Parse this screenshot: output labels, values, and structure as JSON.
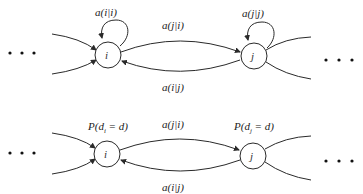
{
  "diagrams": [
    {
      "name": "top-chain",
      "nodes": [
        {
          "id": "i",
          "label": "i",
          "self_loop_label": "a(i|i)"
        },
        {
          "id": "j",
          "label": "j",
          "self_loop_label": "a(j|j)"
        }
      ],
      "edges": [
        {
          "from": "i",
          "to": "j",
          "label": "a(j|i)"
        },
        {
          "from": "j",
          "to": "i",
          "label": "a(i|j)"
        }
      ],
      "ellipsis_left": "• • •",
      "ellipsis_right": "• • •"
    },
    {
      "name": "bottom-chain",
      "nodes": [
        {
          "id": "i",
          "label": "i",
          "prior_label": "P(d",
          "prior_sub": "i",
          "prior_tail": " = d)"
        },
        {
          "id": "j",
          "label": "j",
          "prior_label": "P(d",
          "prior_sub": "j",
          "prior_tail": " = d)"
        }
      ],
      "edges": [
        {
          "from": "i",
          "to": "j",
          "label": "a(j|i)"
        },
        {
          "from": "j",
          "to": "i",
          "label": "a(i|j)"
        }
      ],
      "ellipsis_left": "• • •",
      "ellipsis_right": "• • •"
    }
  ]
}
